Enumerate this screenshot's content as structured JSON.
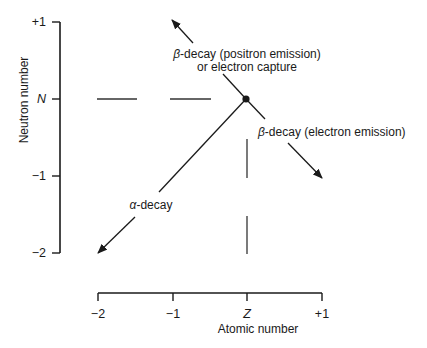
{
  "diagram": {
    "y_axis": {
      "label": "Neutron number",
      "ticks": [
        "+1",
        "N",
        "−1",
        "−2"
      ]
    },
    "x_axis": {
      "label": "Atomic number",
      "ticks": [
        "−2",
        "−1",
        "Z",
        "+1"
      ]
    },
    "origin_label": "(Z, N)",
    "decays": [
      {
        "name": "beta-plus",
        "symbol": "β",
        "label_rest": "-decay (positron emission)",
        "label_line2": "or electron capture",
        "direction": "Z−1, N+1"
      },
      {
        "name": "beta-minus",
        "symbol": "β",
        "label_rest": "-decay (electron emission)",
        "direction": "Z+1, N−1"
      },
      {
        "name": "alpha",
        "symbol": "α",
        "label_rest": "-decay",
        "direction": "Z−2, N−2"
      }
    ]
  },
  "colors": {
    "ink": "#1a1a1a",
    "background": "#ffffff"
  }
}
